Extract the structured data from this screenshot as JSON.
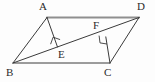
{
  "figure": {
    "kind": "geometry-diagram",
    "canvas": {
      "width": 155,
      "height": 82
    },
    "background_color": "#fdfdfd",
    "stroke_color": "#3a3a3a",
    "top_edge_color": "#8a8a8a",
    "label_color": "#2b2b2b"
  },
  "points": {
    "A": {
      "label": "A",
      "x": 47,
      "y": 17,
      "label_x": 39,
      "label_y": 2
    },
    "B": {
      "label": "B",
      "x": 13,
      "y": 63,
      "label_x": 7,
      "label_y": 66
    },
    "C": {
      "label": "C",
      "x": 110,
      "y": 63,
      "label_x": 105,
      "label_y": 66
    },
    "D": {
      "label": "D",
      "x": 138,
      "y": 17,
      "label_x": 137,
      "label_y": 2
    },
    "E": {
      "label": "E",
      "x": 57,
      "y": 47,
      "label_x": 58,
      "label_y": 48
    },
    "F": {
      "label": "F",
      "x": 106,
      "y": 37,
      "label_x": 93,
      "label_y": 21
    }
  },
  "segments": [
    {
      "name": "AD",
      "from": "A",
      "to": "D",
      "style": "thick-gray"
    },
    {
      "name": "AB",
      "from": "A",
      "to": "B",
      "style": "normal"
    },
    {
      "name": "BC",
      "from": "B",
      "to": "C",
      "style": "normal"
    },
    {
      "name": "CD",
      "from": "C",
      "to": "D",
      "style": "normal"
    },
    {
      "name": "BD",
      "from": "B",
      "to": "D",
      "style": "normal"
    },
    {
      "name": "AE",
      "from": "A",
      "to": "E",
      "style": "normal"
    },
    {
      "name": "CF",
      "from": "C",
      "to": "F",
      "style": "normal"
    }
  ],
  "right_angle_marks": [
    {
      "name": "right-angle-at-E",
      "at": "E",
      "size": 8
    },
    {
      "name": "right-angle-at-F",
      "at": "F",
      "size": 8
    }
  ]
}
